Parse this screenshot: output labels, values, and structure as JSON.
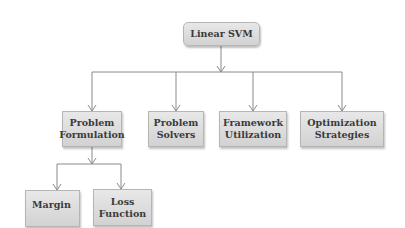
{
  "diagram": {
    "root": {
      "label": "Linear SVM"
    },
    "children": [
      {
        "label": "Problem Formulation",
        "lines": [
          "Problem",
          "Formulation"
        ]
      },
      {
        "label": "Problem Solvers",
        "lines": [
          "Problem",
          "Solvers"
        ]
      },
      {
        "label": "Framework Utilization",
        "lines": [
          "Framework",
          "Utilization"
        ]
      },
      {
        "label": "Optimization Strategies",
        "lines": [
          "Optimization",
          "Strategies"
        ]
      }
    ],
    "grandchildren": [
      {
        "parent": "Problem Formulation",
        "label": "Margin",
        "lines": [
          "Margin"
        ]
      },
      {
        "parent": "Problem Formulation",
        "label": "Loss Function",
        "lines": [
          "Loss",
          "Function"
        ]
      }
    ],
    "colors": {
      "box_fill": "#dcdcdc",
      "box_border": "#b5b5b5",
      "connector": "#8a8a8a",
      "text": "#3a3a3a"
    }
  }
}
